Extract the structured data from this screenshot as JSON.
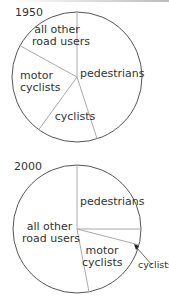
{
  "chart_data": [
    {
      "type": "pie",
      "title": "1950",
      "start_angle": "12 o'clock, clockwise",
      "categories": [
        "pedestrians",
        "cyclists",
        "motor cyclists",
        "all other road users"
      ],
      "values": [
        45,
        15,
        23,
        17
      ],
      "labels": {
        "pedestrians": "pedestrians",
        "cyclists": "cyclists",
        "motor_line1": "motor",
        "motor_line2": "cyclists",
        "other_line1": "all other",
        "other_line2": "road users"
      }
    },
    {
      "type": "pie",
      "title": "2000",
      "start_angle": "12 o'clock, clockwise",
      "categories": [
        "pedestrians",
        "cyclists",
        "motor cyclists",
        "all other road users"
      ],
      "values": [
        25,
        4,
        18,
        53
      ],
      "labels": {
        "pedestrians": "pedestrians",
        "cyclists": "cyclists",
        "motor_line1": "motor",
        "motor_line2": "cyclists",
        "other_line1": "all other",
        "other_line2": "road users"
      },
      "annotation": "cyclists label placed outside circle with arrow pointing to thin slice"
    }
  ],
  "colors": {
    "outline": "#555555",
    "divider": "#aaaaaa",
    "text": "#333333",
    "fill": "#ffffff"
  }
}
